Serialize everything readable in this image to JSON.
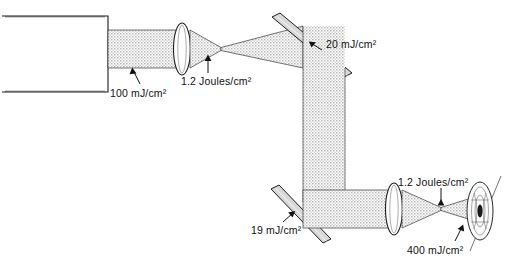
{
  "diagram": {
    "background_color": "#ffffff",
    "beam_color": "#9a9a9a",
    "line_color": "#1c1c1c",
    "mirror_color": "#d8d8d8",
    "components": [
      {
        "id": "laser-source",
        "name": "laser source housing",
        "shape": "open rectangle"
      },
      {
        "id": "lens-1",
        "name": "first converging lens",
        "shape": "biconvex lens"
      },
      {
        "id": "mirror-upper",
        "name": "upper turning mirror",
        "shape": "tilted flat mirror"
      },
      {
        "id": "mirror-lower",
        "name": "lower turning mirror",
        "shape": "tilted flat mirror"
      },
      {
        "id": "lens-2",
        "name": "second converging lens",
        "shape": "biconvex lens"
      },
      {
        "id": "eye-target",
        "name": "human eye",
        "shape": "eye cross-section"
      }
    ],
    "labels": [
      {
        "id": "label-source-fluence",
        "text": "100 mJ/cm²"
      },
      {
        "id": "label-focus-1",
        "text": "1.2 Joules/cm²"
      },
      {
        "id": "label-mirror-upper",
        "text": "20 mJ/cm²"
      },
      {
        "id": "label-mirror-lower",
        "text": "19 mJ/cm²"
      },
      {
        "id": "label-focus-2",
        "text": "1.2 Joules/cm²"
      },
      {
        "id": "label-eye-fluence",
        "text": "400 mJ/cm²"
      }
    ]
  }
}
